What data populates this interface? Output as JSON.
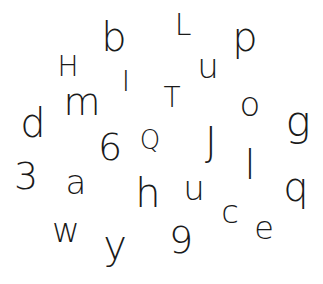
{
  "canvas": {
    "background": "#ffffff",
    "ink_color": "#1a1a1a"
  },
  "glyphs": [
    {
      "char": "b",
      "x": 114,
      "y": 37,
      "size": 40
    },
    {
      "char": "L",
      "x": 183,
      "y": 25,
      "size": 30
    },
    {
      "char": "p",
      "x": 245,
      "y": 37,
      "size": 40
    },
    {
      "char": "H",
      "x": 68,
      "y": 67,
      "size": 28
    },
    {
      "char": "u",
      "x": 208,
      "y": 66,
      "size": 34
    },
    {
      "char": "I",
      "x": 126,
      "y": 82,
      "size": 28
    },
    {
      "char": "m",
      "x": 82,
      "y": 102,
      "size": 38
    },
    {
      "char": "T",
      "x": 172,
      "y": 98,
      "size": 28
    },
    {
      "char": "o",
      "x": 250,
      "y": 104,
      "size": 34
    },
    {
      "char": "g",
      "x": 298,
      "y": 122,
      "size": 42
    },
    {
      "char": "d",
      "x": 33,
      "y": 123,
      "size": 40
    },
    {
      "char": "6",
      "x": 110,
      "y": 147,
      "size": 38
    },
    {
      "char": "Q",
      "x": 150,
      "y": 140,
      "size": 26
    },
    {
      "char": "J",
      "x": 211,
      "y": 142,
      "size": 40
    },
    {
      "char": "l",
      "x": 250,
      "y": 165,
      "size": 40
    },
    {
      "char": "q",
      "x": 296,
      "y": 187,
      "size": 40
    },
    {
      "char": "3",
      "x": 26,
      "y": 176,
      "size": 38
    },
    {
      "char": "a",
      "x": 76,
      "y": 182,
      "size": 34
    },
    {
      "char": "h",
      "x": 148,
      "y": 193,
      "size": 40
    },
    {
      "char": "u",
      "x": 194,
      "y": 188,
      "size": 34
    },
    {
      "char": "c",
      "x": 230,
      "y": 212,
      "size": 32
    },
    {
      "char": "e",
      "x": 264,
      "y": 228,
      "size": 32
    },
    {
      "char": "w",
      "x": 66,
      "y": 230,
      "size": 34
    },
    {
      "char": "y",
      "x": 115,
      "y": 245,
      "size": 40
    },
    {
      "char": "9",
      "x": 181,
      "y": 240,
      "size": 38
    }
  ]
}
